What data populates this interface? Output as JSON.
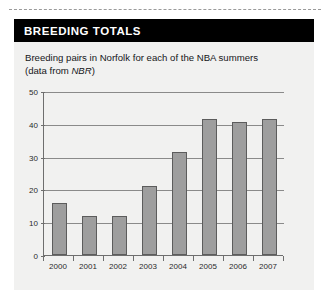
{
  "panel": {
    "header_title": "BREEDING TOTALS",
    "subtitle_line1": "Breeding pairs in Norfolk for each of the NBA summers",
    "subtitle_line2_pre": "(data from ",
    "subtitle_line2_italic": "NBR",
    "subtitle_line2_post": ")"
  },
  "colors": {
    "header_bg": "#000000",
    "header_text": "#ffffff",
    "panel_bg": "#f1f1f0",
    "bar_fill": "#9e9e9e",
    "bar_stroke": "#5c5c5c",
    "grid": "#8a8a8a",
    "axis": "#6e6e6e"
  },
  "chart_data": {
    "type": "bar",
    "title": "BREEDING TOTALS",
    "subtitle": "Breeding pairs in Norfolk for each of the NBA summers (data from NBR)",
    "xlabel": "",
    "ylabel": "",
    "categories": [
      "2000",
      "2001",
      "2002",
      "2003",
      "2004",
      "2005",
      "2006",
      "2007"
    ],
    "values": [
      16,
      12,
      12,
      21,
      31.5,
      41.5,
      40.5,
      41.5
    ],
    "ylim": [
      0,
      50
    ],
    "yticks": [
      0,
      10,
      20,
      30,
      40,
      50
    ],
    "ytick_labels": [
      "0",
      "10",
      "20",
      "30",
      "40",
      "50"
    ],
    "grid": true,
    "legend": false
  }
}
